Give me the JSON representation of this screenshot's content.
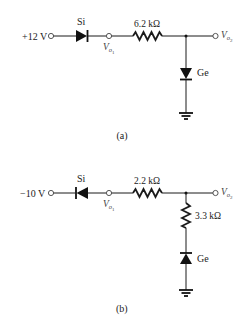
{
  "figure": {
    "circuits": [
      {
        "id": "a",
        "caption": "(a)",
        "source_label": "+12 V",
        "series_diode": {
          "material": "Si",
          "orientation": "forward (anode left)"
        },
        "node1_label": "V",
        "node1_sub": "o",
        "node1_subsub": "1",
        "series_resistor": "6.2 kΩ",
        "output_label": "V",
        "output_sub": "o",
        "output_subsub": "2",
        "shunt_resistor": null,
        "shunt_diode": {
          "material": "Ge",
          "orientation": "anode at top, to ground"
        }
      },
      {
        "id": "b",
        "caption": "(b)",
        "source_label": "−10 V",
        "series_diode": {
          "material": "Si",
          "orientation": "reversed (cathode left)"
        },
        "node1_label": "V",
        "node1_sub": "o",
        "node1_subsub": "1",
        "series_resistor": "2.2 kΩ",
        "output_label": "V",
        "output_sub": "o",
        "output_subsub": "2",
        "shunt_resistor": "3.3 kΩ",
        "shunt_diode": {
          "material": "Ge",
          "orientation": "cathode at top, anode to ground"
        }
      }
    ]
  }
}
